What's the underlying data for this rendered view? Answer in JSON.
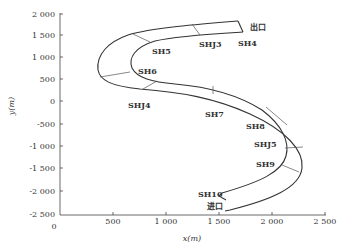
{
  "figure": {
    "y_axis": {
      "title": "y(m)",
      "ticks": [
        "2 000",
        "1 500",
        "1 000",
        "500",
        "0",
        "-500",
        "-1 000",
        "-1 500",
        "-2 000",
        "-2 500"
      ]
    },
    "x_axis": {
      "title": "x(m)",
      "ticks": [
        "0",
        "500",
        "1 000",
        "1 500",
        "2 000",
        "2 500"
      ]
    },
    "labels": {
      "exit": "出口",
      "entrance": "进口",
      "sections": {
        "SH4": "SH4",
        "SHJ3": "SHJ3",
        "SH5": "SH5",
        "SH6": "SH6",
        "SHJ4": "SHJ4",
        "SH7": "SH7",
        "SH8": "SH8",
        "SHJ5": "SHJ5",
        "SH9": "SH9",
        "SH10": "SH10"
      }
    }
  }
}
